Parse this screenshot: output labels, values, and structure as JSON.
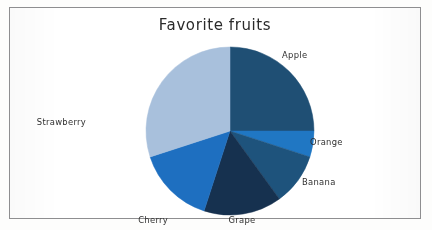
{
  "chart_data": {
    "type": "pie",
    "title": "Favorite fruits",
    "xlabel": "",
    "ylabel": "",
    "legend_position": "none",
    "labels_position": "outside",
    "grid": false,
    "start_angle_deg": 90,
    "direction": "clockwise",
    "categories": [
      "Apple",
      "Orange",
      "Banana",
      "Grape",
      "Cherry",
      "Strawberry"
    ],
    "values": [
      25,
      5,
      10,
      15,
      15,
      30
    ],
    "units": "percent",
    "colors": [
      "#1f4f74",
      "#2077c3",
      "#1e537c",
      "#16314f",
      "#1e6fc0",
      "#a8c0dc"
    ],
    "slices": [
      {
        "label": "Apple",
        "value": 25,
        "color": "#1f4f74",
        "start_deg": 90,
        "end_deg": 0,
        "label_x": 272,
        "label_y": 50
      },
      {
        "label": "Orange",
        "value": 5,
        "color": "#2077c3",
        "start_deg": 0,
        "end_deg": -18,
        "label_x": 300,
        "label_y": 137
      },
      {
        "label": "Banana",
        "value": 10,
        "color": "#1e537c",
        "start_deg": -18,
        "end_deg": -54,
        "label_x": 292,
        "label_y": 177
      },
      {
        "label": "Grape",
        "value": 15,
        "color": "#16314f",
        "start_deg": -54,
        "end_deg": -108,
        "label_x": 232,
        "label_y": 215
      },
      {
        "label": "Cherry",
        "value": 15,
        "color": "#1e6fc0",
        "start_deg": -108,
        "end_deg": -162,
        "label_x": 158,
        "label_y": 215
      },
      {
        "label": "Strawberry",
        "value": 30,
        "color": "#a8c0dc",
        "start_deg": -162,
        "end_deg": -270,
        "label_x": 76,
        "label_y": 117
      }
    ]
  },
  "chart": {
    "title": "Favorite fruits",
    "center_x": 220,
    "center_y": 123,
    "radius": 84
  },
  "labels": {
    "apple": "Apple",
    "orange": "Orange",
    "banana": "Banana",
    "grape": "Grape",
    "cherry": "Cherry",
    "strawberry": "Strawberry"
  }
}
